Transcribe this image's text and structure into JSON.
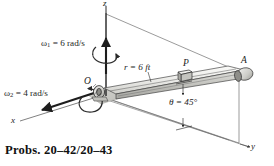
{
  "figure": {
    "kind": "engineering-mechanics-3d-diagram",
    "axes": {
      "z_label": "z",
      "x_label": "x",
      "y_label": "y"
    },
    "points": {
      "origin_label": "O",
      "collar_label": "P",
      "end_label": "A"
    },
    "annotations": {
      "omega1_symbol": "ω",
      "omega1_subscript": "1",
      "omega1_value": " = 6 rad/s",
      "omega2_symbol": "ω",
      "omega2_subscript": "2",
      "omega2_value": " = 4 rad/s",
      "radius": "r = 6 ft",
      "angle": "θ = 45°"
    },
    "colors": {
      "line": "#1d1d1d",
      "thin_line": "#4a4a4a",
      "rod_light": "#f0f0ee",
      "rod_mid": "#d6d6d2",
      "rod_dark": "#b0b0ab",
      "ground_shade": "#c9c9c4",
      "background": "#ffffff"
    }
  },
  "caption": {
    "text": "Probs. 20–42/20–43"
  }
}
